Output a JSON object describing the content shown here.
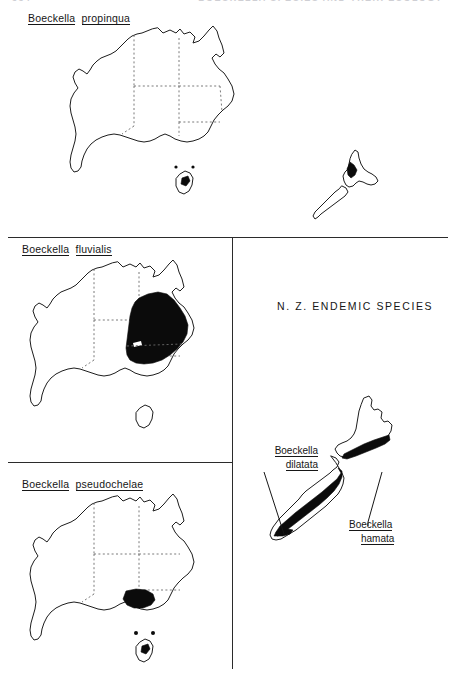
{
  "figure": {
    "running_head": {
      "left": "334",
      "right": "BOECKELLA  SPECIES  AND  THEIR  ECOLOGY"
    }
  },
  "panels": [
    {
      "id": "propinqua",
      "label_genus": "Boeckella",
      "label_species": "propinqua",
      "maps": [
        "australia",
        "new-zealand"
      ],
      "distribution": "Filled range on the central North Island of New Zealand; scattered occurrence marked in Tasmania, Australia."
    },
    {
      "id": "fluvialis",
      "label_genus": "Boeckella",
      "label_species": "fluvialis",
      "maps": [
        "australia"
      ],
      "distribution": "Large filled range across eastern Australia covering New South Wales and southern Queensland."
    },
    {
      "id": "pseudochelae",
      "label_genus": "Boeckella",
      "label_species": "pseudochelae",
      "maps": [
        "australia"
      ],
      "distribution": "Filled range in Victoria, south-eastern Australia, with point records in Tasmania."
    }
  ],
  "nz_panel": {
    "heading": "N. Z.  ENDEMIC  SPECIES",
    "callouts": [
      {
        "id": "dilatata",
        "genus": "Boeckella",
        "species": "dilatata",
        "target": "South Island western range band"
      },
      {
        "id": "hamata",
        "genus": "Boeckella",
        "species": "hamata",
        "target": "North Island southern range band"
      }
    ]
  },
  "colors": {
    "range_fill": "#0b0b0b",
    "coast_stroke": "#1d1d1d",
    "state_border": "#6b6b6b",
    "rule": "#2b2b2b",
    "background": "#ffffff"
  }
}
